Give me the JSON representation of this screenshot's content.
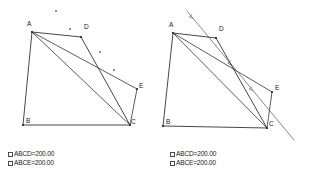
{
  "figure": {
    "panel_count": 2
  },
  "measurements": {
    "rows": [
      {
        "id": "abcd",
        "label": "ABCD=200.00",
        "checkbox": "checkbox-unchecked",
        "checked": false
      },
      {
        "id": "abce",
        "label": "ABCE=200.00",
        "checkbox": "checkbox-unchecked",
        "checked": false
      }
    ]
  },
  "panels": [
    {
      "id": "left",
      "name": "construction-panel-left",
      "vertices": [
        {
          "id": "A",
          "label": "A",
          "x": 32,
          "y": 32,
          "label_x": 27,
          "label_y": 26
        },
        {
          "id": "B",
          "label": "B",
          "x": 23,
          "y": 125,
          "label_x": 26,
          "label_y": 123
        },
        {
          "id": "C",
          "label": "C",
          "x": 130,
          "y": 125,
          "label_x": 131,
          "label_y": 124
        },
        {
          "id": "D",
          "label": "D",
          "x": 81,
          "y": 37,
          "label_x": 84,
          "label_y": 29
        },
        {
          "id": "E",
          "label": "E",
          "x": 137,
          "y": 89,
          "label_x": 139,
          "label_y": 88
        }
      ],
      "edges": [
        {
          "from": "A",
          "to": "D",
          "kind": "outline"
        },
        {
          "from": "D",
          "to": "C",
          "kind": "outline"
        },
        {
          "from": "C",
          "to": "B",
          "kind": "outline"
        },
        {
          "from": "B",
          "to": "A",
          "kind": "outline"
        },
        {
          "from": "A",
          "to": "C",
          "kind": "diagonal"
        },
        {
          "from": "A",
          "to": "E",
          "kind": "diagonal"
        },
        {
          "from": "E",
          "to": "C",
          "kind": "diagonal"
        }
      ],
      "trace_points": [
        {
          "x": 56,
          "y": 11
        },
        {
          "x": 70,
          "y": 29
        },
        {
          "x": 100,
          "y": 52
        },
        {
          "x": 114,
          "y": 70
        }
      ],
      "ray": null
    },
    {
      "id": "right",
      "name": "construction-panel-right",
      "vertices": [
        {
          "id": "A",
          "label": "A",
          "x": 11,
          "y": 33,
          "label_x": 7,
          "label_y": 27
        },
        {
          "id": "B",
          "label": "B",
          "x": 1,
          "y": 126,
          "label_x": 4,
          "label_y": 124
        },
        {
          "id": "C",
          "label": "C",
          "x": 105,
          "y": 128,
          "label_x": 107,
          "label_y": 126
        },
        {
          "id": "D",
          "label": "D",
          "x": 54,
          "y": 38,
          "label_x": 57,
          "label_y": 31
        },
        {
          "id": "E",
          "label": "E",
          "x": 110,
          "y": 92,
          "label_x": 113,
          "label_y": 90
        }
      ],
      "edges": [
        {
          "from": "A",
          "to": "D",
          "kind": "outline"
        },
        {
          "from": "D",
          "to": "C",
          "kind": "outline"
        },
        {
          "from": "C",
          "to": "B",
          "kind": "outline"
        },
        {
          "from": "B",
          "to": "A",
          "kind": "outline"
        },
        {
          "from": "A",
          "to": "C",
          "kind": "diagonal"
        },
        {
          "from": "A",
          "to": "E",
          "kind": "diagonal"
        },
        {
          "from": "E",
          "to": "C",
          "kind": "diagonal"
        }
      ],
      "trace_points": [],
      "ray": {
        "name": "direction-ray",
        "x1": 25,
        "y1": 11,
        "x2": 132,
        "y2": 140,
        "arrow_markers": [
          {
            "t": 0.06
          },
          {
            "t": 0.42
          },
          {
            "t": 0.62
          }
        ]
      }
    }
  ],
  "colors": {
    "edge": "#333333",
    "ray": "#6a6a6a",
    "text": "#1a1a1a",
    "background": "#ffffff",
    "checkbox_border": "#4a4a4a"
  }
}
